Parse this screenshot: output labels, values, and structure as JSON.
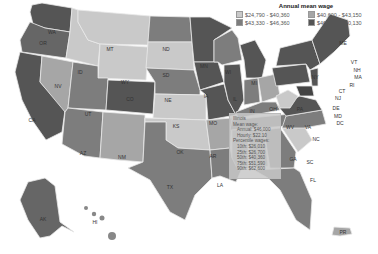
{
  "legend": {
    "title": "Annual mean wage",
    "items": [
      {
        "label": "$24,790 - $40,360",
        "color": "#c9c9c9"
      },
      {
        "label": "$40,600 - $43,150",
        "color": "#a6a6a6"
      },
      {
        "label": "$43,330 - $46,360",
        "color": "#7d7d7d"
      },
      {
        "label": "$46,480 - $60,130",
        "color": "#555555"
      }
    ]
  },
  "tooltip": {
    "state": "Illinois",
    "mean_wage_label": "Mean wage:",
    "annual": "Annual: $46,000",
    "hourly": "Hourly: $22.10",
    "percentile_label": "Percentile wages:",
    "p10": "10th: $26,010",
    "p25": "25th: $26,700",
    "p50": "50th: $40,360",
    "p75": "75th: $51,590",
    "p90": "90th: $62,600"
  },
  "states": {
    "WA": "WA",
    "OR": "OR",
    "CA": "CA",
    "NV": "NV",
    "ID": "ID",
    "MT": "MT",
    "WY": "WY",
    "UT": "UT",
    "AZ": "AZ",
    "CO": "CO",
    "NM": "NM",
    "ND": "ND",
    "SD": "SD",
    "NE": "NE",
    "KS": "KS",
    "OK": "OK",
    "TX": "TX",
    "MN": "MN",
    "IA": "IA",
    "MO": "MO",
    "AR": "AR",
    "LA": "LA",
    "WI": "WI",
    "IL": "IL",
    "MI": "MI",
    "IN": "IN",
    "OH": "OH",
    "KY": "KY",
    "TN": "TN",
    "MS": "MS",
    "AL": "AL",
    "GA": "GA",
    "FL": "FL",
    "SC": "SC",
    "NC": "NC",
    "VA": "VA",
    "WV": "WV",
    "PA": "PA",
    "NY": "NY",
    "VT": "VT",
    "NH": "NH",
    "ME": "ME",
    "MA": "MA",
    "RI": "RI",
    "CT": "CT",
    "NJ": "NJ",
    "DE": "DE",
    "MD": "MD",
    "DC": "DC",
    "AK": "AK",
    "HI": "HI",
    "PR": "PR"
  }
}
